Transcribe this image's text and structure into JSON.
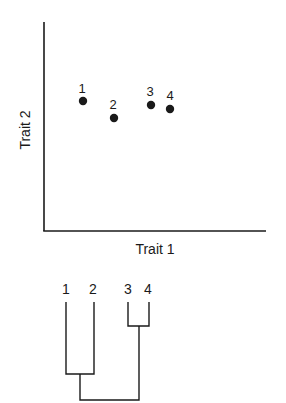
{
  "scatter": {
    "xlabel": "Trait 1",
    "ylabel": "Trait 2",
    "points": [
      {
        "label": "1",
        "x": 83,
        "y": 101
      },
      {
        "label": "2",
        "x": 114,
        "y": 118
      },
      {
        "label": "3",
        "x": 151,
        "y": 105
      },
      {
        "label": "4",
        "x": 170,
        "y": 109
      }
    ]
  },
  "dendrogram": {
    "leaves": [
      {
        "label": "1"
      },
      {
        "label": "2"
      },
      {
        "label": "3"
      },
      {
        "label": "4"
      }
    ],
    "clusters": [
      {
        "members": [
          "1",
          "2"
        ],
        "height": "low"
      },
      {
        "members": [
          "3",
          "4"
        ],
        "height": "high"
      },
      {
        "members": [
          "1",
          "2",
          "3",
          "4"
        ],
        "height": "root"
      }
    ]
  },
  "colors": {
    "ink": "#1a1a1a",
    "background": "#ffffff"
  }
}
